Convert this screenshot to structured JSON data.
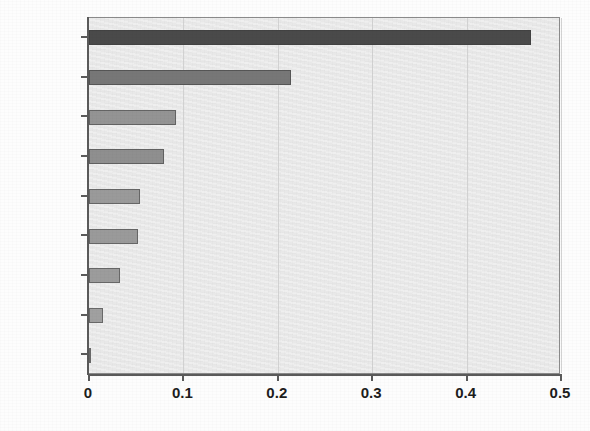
{
  "chart_data": {
    "type": "bar",
    "orientation": "horizontal",
    "title": "",
    "subtitle": "",
    "xlabel": "",
    "ylabel": "",
    "categories": [
      "Max_1",
      "Max_C2",
      "Max_2",
      "Max_C1",
      "N_EL",
      "N_1",
      "N_C2",
      "N_C1",
      "N_2"
    ],
    "values": [
      0.468,
      0.214,
      0.092,
      0.079,
      0.054,
      0.052,
      0.033,
      0.015,
      0.002
    ],
    "xlim": [
      0,
      0.5
    ],
    "xticks": [
      0,
      0.1,
      0.2,
      0.3,
      0.4,
      0.5
    ],
    "xticklabels": [
      "0",
      "0.1",
      "0.2",
      "0.3",
      "0.4",
      "0.5"
    ],
    "grid": "vertical",
    "legend": "none",
    "annotations": [],
    "bar_colors": [
      "#4a4a4a",
      "#777777",
      "#949494",
      "#8f8f8f",
      "#9a9a9a",
      "#9a9a9a",
      "#9c9c9c",
      "#a0a0a0",
      "#a0a0a0"
    ],
    "plot_background": "#ebebeb",
    "axis_color": "#5a5a5a",
    "grid_color": "#d2d2d2"
  }
}
